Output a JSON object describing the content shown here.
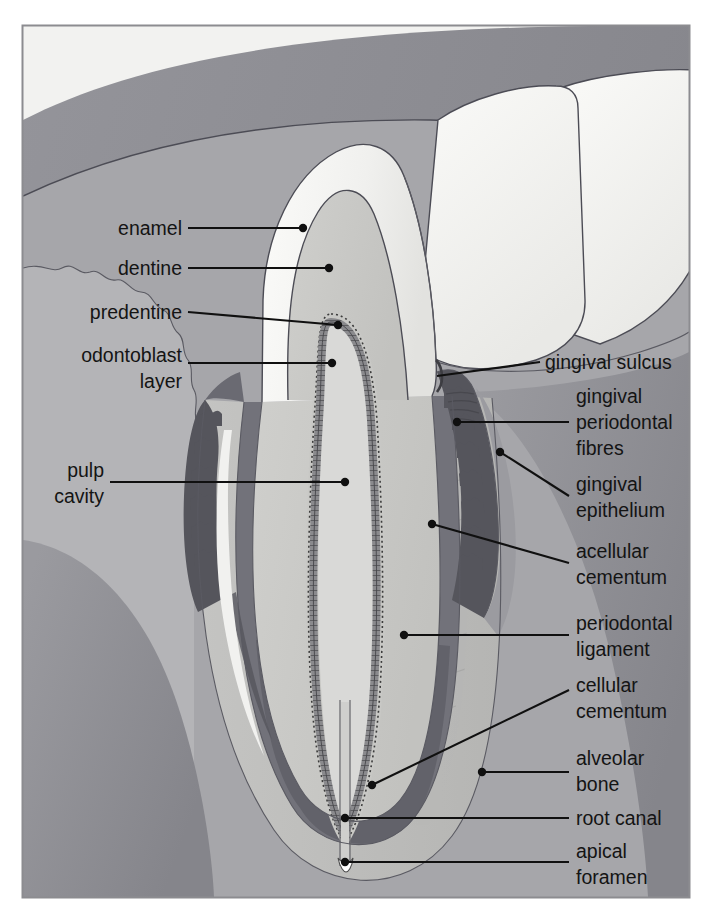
{
  "figure": {
    "frame": {
      "x": 22,
      "y": 25,
      "width": 668,
      "height": 873
    }
  },
  "palette": {
    "page_background": "#ffffff",
    "frame_border": "#8c8c90",
    "gingiva_outer": "#8e8e93",
    "gingiva_inner": "#a9a9ad",
    "alveolar_bone": "#8e8e93",
    "periodontal_ligament": "#bdbdbd",
    "cementum_band": "#6e6e73",
    "enamel": "#f2f2f0",
    "dentine": "#c9c9c7",
    "predentine": "#bdbdba",
    "odontoblast_layer": "#7d7d80",
    "pulp_cavity": "#d8d8d6",
    "adjacent_tooth": "#f4f4f2",
    "gingival_epithelium": "#5e5e63",
    "root_canal": "#9a9a9e",
    "label_text": "#141414",
    "leader_line": "#101010"
  },
  "labels": {
    "left": [
      {
        "id": "enamel",
        "text": "enamel",
        "lines": [
          "enamel"
        ]
      },
      {
        "id": "dentine",
        "text": "dentine",
        "lines": [
          "dentine"
        ]
      },
      {
        "id": "predentine",
        "text": "predentine",
        "lines": [
          "predentine"
        ]
      },
      {
        "id": "odontoblast-layer",
        "text": "odontoblast layer",
        "lines": [
          "odontoblast",
          "layer"
        ]
      },
      {
        "id": "pulp-cavity",
        "text": "pulp cavity",
        "lines": [
          "pulp",
          "cavity"
        ]
      }
    ],
    "right": [
      {
        "id": "gingival-sulcus",
        "text": "gingival sulcus",
        "lines": [
          "gingival sulcus"
        ]
      },
      {
        "id": "gingival-periodontal-fibres",
        "text": "gingival periodontal fibres",
        "lines": [
          "gingival",
          "periodontal",
          "fibres"
        ]
      },
      {
        "id": "gingival-epithelium",
        "text": "gingival epithelium",
        "lines": [
          "gingival",
          "epithelium"
        ]
      },
      {
        "id": "acellular-cementum",
        "text": "acellular cementum",
        "lines": [
          "acellular",
          "cementum"
        ]
      },
      {
        "id": "periodontal-ligament",
        "text": "periodontal ligament",
        "lines": [
          "periodontal",
          "ligament"
        ]
      },
      {
        "id": "cellular-cementum",
        "text": "cellular cementum",
        "lines": [
          "cellular",
          "cementum"
        ]
      },
      {
        "id": "alveolar-bone",
        "text": "alveolar bone",
        "lines": [
          "alveolar",
          "bone"
        ]
      },
      {
        "id": "root-canal",
        "text": "root canal",
        "lines": [
          "root canal"
        ]
      },
      {
        "id": "apical-foramen",
        "text": "apical foramen",
        "lines": [
          "apical",
          "foramen"
        ]
      }
    ]
  },
  "label_text": {
    "enamel": "enamel",
    "dentine": "dentine",
    "predentine": "predentine",
    "odontoblast_1": "odontoblast",
    "odontoblast_2": "layer",
    "pulp_1": "pulp",
    "pulp_2": "cavity",
    "gingival_sulcus": "gingival sulcus",
    "gpf_1": "gingival",
    "gpf_2": "periodontal",
    "gpf_3": "fibres",
    "ge_1": "gingival",
    "ge_2": "epithelium",
    "ac_1": "acellular",
    "ac_2": "cementum",
    "pl_1": "periodontal",
    "pl_2": "ligament",
    "cc_1": "cellular",
    "cc_2": "cementum",
    "ab_1": "alveolar",
    "ab_2": "bone",
    "root_canal": "root canal",
    "af_1": "apical",
    "af_2": "foramen"
  }
}
